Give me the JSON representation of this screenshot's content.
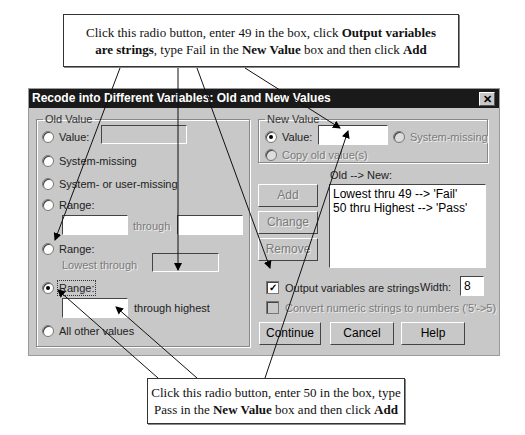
{
  "callouts": {
    "top": {
      "parts": [
        {
          "text": "Click this radio button, enter 49 in the box, click ",
          "bold": false
        },
        {
          "text": "Output variables",
          "bold": true
        },
        {
          "text": "are strings",
          "bold": true
        },
        {
          "text": ", type Fail in the ",
          "bold": false
        },
        {
          "text": "New Value",
          "bold": true
        },
        {
          "text": " box and then click ",
          "bold": false
        },
        {
          "text": "Add",
          "bold": true
        }
      ]
    },
    "bottom": {
      "line1": "Click this radio button, enter 50 in the box, type",
      "line2_a": "Pass in the ",
      "line2_b": "New Value",
      "line2_c": " box and then click ",
      "line2_d": "Add"
    }
  },
  "dialog": {
    "title": "Recode into Different Variables: Old and New Values",
    "close_glyph": "✕",
    "old_value": {
      "legend": "Old Value",
      "value_label": "Value:",
      "value_input": "",
      "system_missing": "System-missing",
      "system_or_user_missing": "System- or user-missing",
      "range_label": "Range:",
      "range_from": "",
      "through": "through",
      "range_to": "",
      "range_lowest_label": "Range:",
      "lowest_through": "Lowest through",
      "lowest_input": "",
      "range_highest_label": "Range:",
      "highest_input": "",
      "through_highest": "through highest",
      "all_other": "All other values",
      "selected": "range_highest"
    },
    "new_value": {
      "legend": "New Value",
      "value_label": "Value:",
      "value_input": "",
      "system_missing": "System-missing",
      "copy_old": "Copy old value(s)",
      "selected": "value"
    },
    "mapping": {
      "label": "Old --> New:",
      "items": [
        "Lowest thru 49 --> 'Fail'",
        "50 thru Highest --> 'Pass'"
      ]
    },
    "buttons": {
      "add": "Add",
      "change": "Change",
      "remove": "Remove",
      "continue": "Continue",
      "cancel": "Cancel",
      "help": "Help"
    },
    "output_strings": {
      "label": "Output variables are strings",
      "checked": true
    },
    "width": {
      "label": "Width:",
      "value": "8"
    },
    "convert_numeric": {
      "label": "Convert numeric strings to numbers ('5'->5)",
      "checked": false
    }
  }
}
